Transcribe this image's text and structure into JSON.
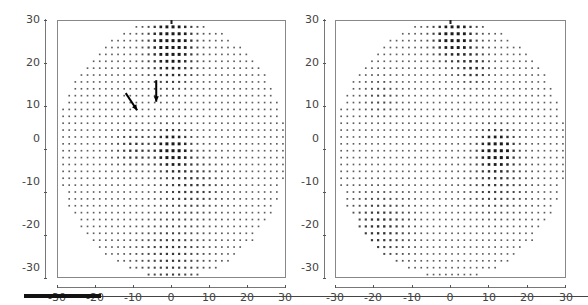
{
  "chart_data": [
    {
      "type": "scatter",
      "title": "",
      "description": "Circular dot-density map (grid of dots within radius 30), darker/larger dots indicate higher density",
      "xlabel": "",
      "ylabel": "",
      "xlim": [
        -30,
        30
      ],
      "ylim": [
        -30,
        30
      ],
      "xticks": [
        -30,
        -20,
        -10,
        0,
        10,
        20,
        30
      ],
      "yticks": [
        30,
        20,
        10,
        0,
        -10,
        -20,
        -30
      ],
      "grid": false,
      "radius": 30,
      "dark_regions": [
        {
          "x": 0,
          "y": 26,
          "strength": 1.0,
          "spread": 3.5
        },
        {
          "x": 0,
          "y": 0,
          "strength": 1.0,
          "spread": 3.0
        },
        {
          "x": 0,
          "y": 20,
          "strength": 0.5,
          "spread": 4
        },
        {
          "x": -10,
          "y": 0,
          "strength": 0.45,
          "spread": 3
        },
        {
          "x": 5,
          "y": -8,
          "strength": 0.4,
          "spread": 5
        },
        {
          "x": 0,
          "y": -25,
          "strength": 0.35,
          "spread": 6
        }
      ],
      "annotations": [
        {
          "type": "arrow",
          "from": [
            -12,
            13
          ],
          "to": [
            -9,
            9
          ]
        },
        {
          "type": "arrow",
          "from": [
            -4,
            16
          ],
          "to": [
            -4,
            11
          ]
        }
      ]
    },
    {
      "type": "scatter",
      "title": "",
      "description": "Circular dot-density map (grid of dots within radius 30)",
      "xlabel": "",
      "ylabel": "",
      "xlim": [
        -30,
        30
      ],
      "ylim": [
        -30,
        30
      ],
      "xticks": [
        -30,
        -20,
        -10,
        0,
        10,
        20,
        30
      ],
      "yticks": [
        30,
        20,
        10,
        0,
        -10,
        -20,
        -30
      ],
      "grid": false,
      "radius": 30,
      "dark_regions": [
        {
          "x": 1,
          "y": 26,
          "strength": 1.0,
          "spread": 3.5
        },
        {
          "x": 12,
          "y": 0,
          "strength": 1.0,
          "spread": 3.0
        },
        {
          "x": 6,
          "y": 19,
          "strength": 0.5,
          "spread": 2.5
        },
        {
          "x": -18,
          "y": -18,
          "strength": 0.45,
          "spread": 5
        },
        {
          "x": 12,
          "y": -8,
          "strength": 0.35,
          "spread": 5
        },
        {
          "x": -18,
          "y": 12,
          "strength": 0.25,
          "spread": 3
        }
      ],
      "annotations": []
    }
  ],
  "left": {
    "yticks": [
      "30",
      "20",
      "10",
      "0",
      "-10",
      "-20",
      "-30"
    ],
    "xticks": [
      "-30",
      "-20",
      "-10",
      "0",
      "10",
      "20",
      "30"
    ]
  },
  "right": {
    "yticks": [
      "30",
      "20",
      "10",
      "0",
      "-10",
      "-20",
      "-30"
    ],
    "xticks": [
      "-30",
      "-20",
      "-10",
      "0",
      "10",
      "20",
      "30"
    ]
  },
  "colors": {
    "dot": "#1a1a1a",
    "frame": "#888888",
    "axis_text": "#444444"
  }
}
